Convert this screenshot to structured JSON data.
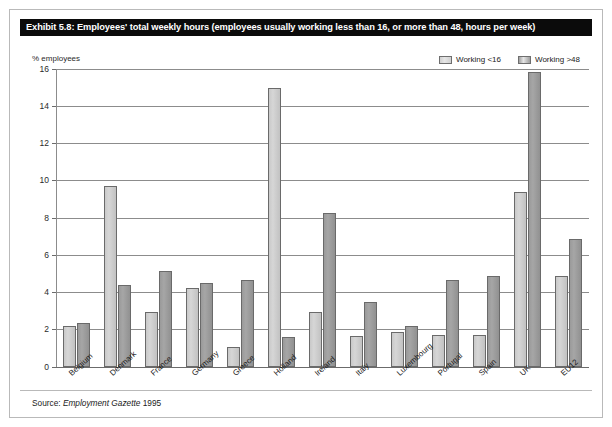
{
  "title": "Exhibit 5.8: Employees' total weekly hours (employees usually working less than 16, or more than 48, hours per week)",
  "axis": {
    "y_title": "% employees"
  },
  "legend": {
    "entries": [
      {
        "label": "Working <16",
        "color": "#d0d0d0",
        "swatch_name": "legend-swatch-working-under-16"
      },
      {
        "label": "Working >48",
        "color": "#9e9e9e",
        "swatch_name": "legend-swatch-working-over-48"
      }
    ]
  },
  "source": {
    "prefix": "Source: ",
    "publication": "Employment Gazette",
    "year": " 1995",
    "full": "Source: Employment Gazette 1995"
  },
  "chart_data": {
    "type": "bar",
    "title": "Exhibit 5.8: Employees' total weekly hours (employees usually working less than 16, or more than 48, hours per week)",
    "xlabel": "",
    "ylabel": "% employees",
    "ylim": [
      0,
      16
    ],
    "yticks": [
      0,
      2,
      4,
      6,
      8,
      10,
      12,
      14,
      16
    ],
    "grid": true,
    "legend_position": "top-right",
    "categories": [
      "Belgium",
      "Denmark",
      "France",
      "Germany",
      "Greece",
      "Holland",
      "Ireland",
      "Italy",
      "Luxembourg",
      "Portugal",
      "Spain",
      "UK",
      "EU12"
    ],
    "series": [
      {
        "name": "Working <16",
        "color": "#d0d0d0",
        "values": [
          2.2,
          9.7,
          2.95,
          4.25,
          1.05,
          15.0,
          2.95,
          1.65,
          1.9,
          1.7,
          1.7,
          9.4,
          4.9
        ]
      },
      {
        "name": "Working >48",
        "color": "#9e9e9e",
        "values": [
          2.35,
          4.4,
          5.15,
          4.5,
          4.65,
          1.6,
          8.25,
          3.5,
          2.2,
          4.65,
          4.9,
          15.85,
          6.9
        ]
      }
    ]
  }
}
